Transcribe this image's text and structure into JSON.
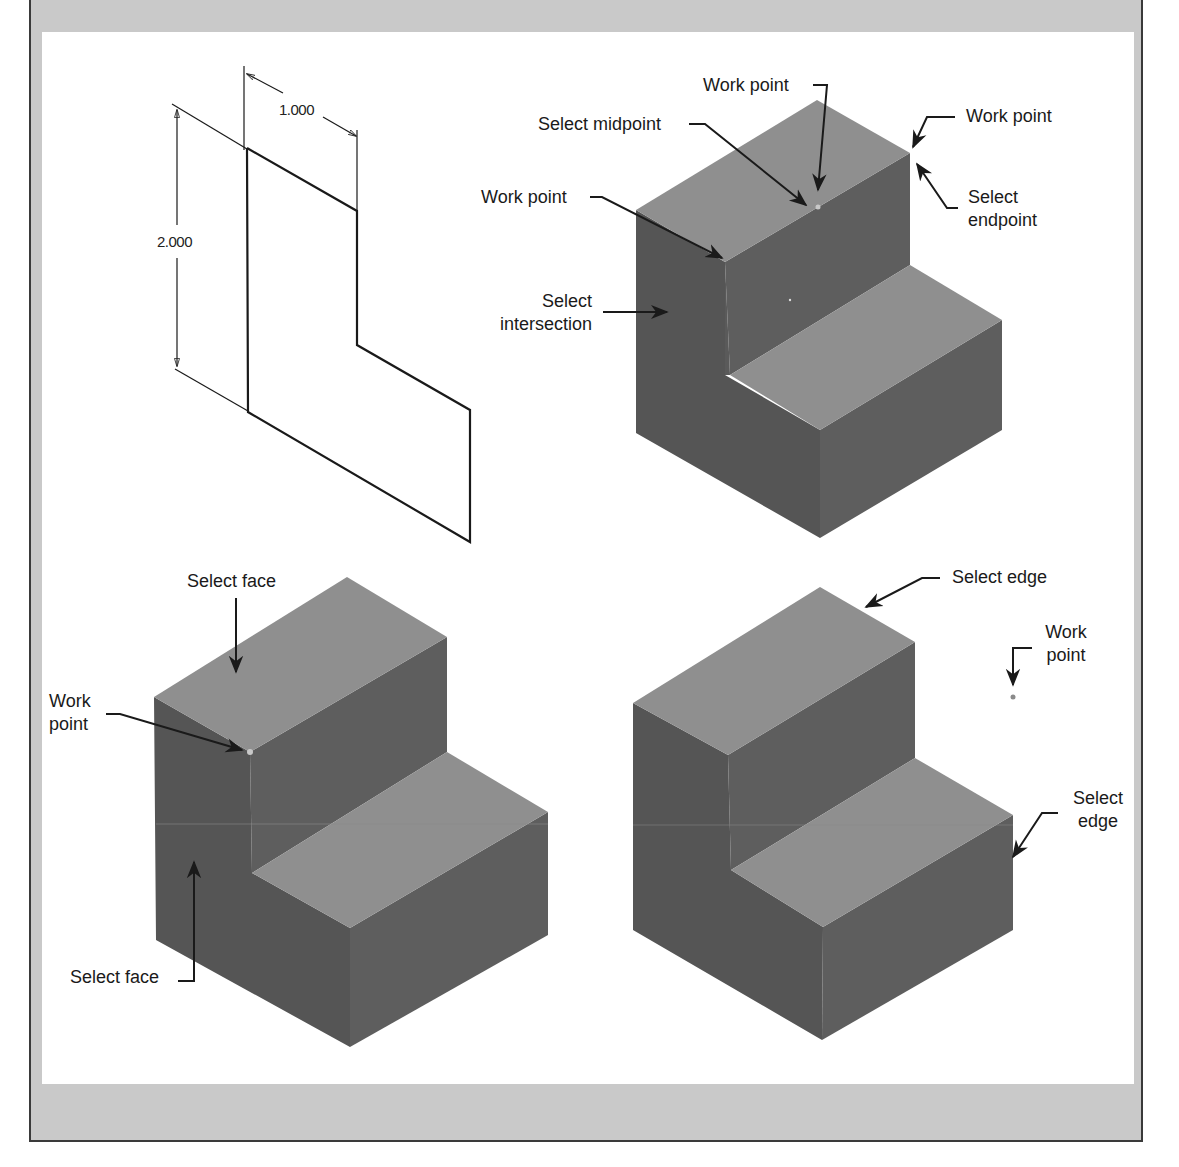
{
  "figure": {
    "colors": {
      "frame_fill": "#c9c9c9",
      "frame_border": "#3a3a3a",
      "panel_bg": "#ffffff",
      "top_face": "#8f8f8f",
      "left_face": "#555555",
      "right_face": "#5e5e5e",
      "line": "#1a1a1a"
    }
  },
  "sketch": {
    "dim_width": "1.000",
    "dim_height": "2.000"
  },
  "view_top_right": {
    "labels": {
      "work_point_top": "Work point",
      "select_midpoint": "Select midpoint",
      "work_point_right": "Work point",
      "select_endpoint_1": "Select",
      "select_endpoint_2": "endpoint",
      "work_point_left": "Work point",
      "select_intersection_1": "Select",
      "select_intersection_2": "intersection"
    }
  },
  "view_bottom_left": {
    "labels": {
      "select_face_top": "Select face",
      "work_point_1": "Work",
      "work_point_2": "point",
      "select_face_bottom": "Select face"
    }
  },
  "view_bottom_right": {
    "labels": {
      "select_edge_top": "Select edge",
      "work_point_1": "Work",
      "work_point_2": "point",
      "select_edge_right_1": "Select",
      "select_edge_right_2": "edge"
    }
  }
}
